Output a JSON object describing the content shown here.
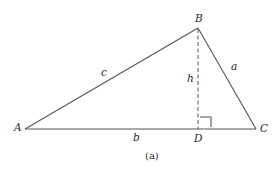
{
  "diagram": {
    "type": "triangle-with-altitude",
    "colors": {
      "line": "#555555",
      "text": "#2a2a2a",
      "background": "#ffffff"
    },
    "vertices": {
      "A": {
        "label": "A",
        "x": 25,
        "y": 129
      },
      "B": {
        "label": "B",
        "x": 198,
        "y": 28
      },
      "C": {
        "label": "C",
        "x": 256,
        "y": 129
      },
      "D": {
        "label": "D",
        "x": 198,
        "y": 129
      }
    },
    "sides": {
      "a": {
        "label": "a",
        "from": "B",
        "to": "C"
      },
      "b": {
        "label": "b",
        "from": "A",
        "to": "C"
      },
      "c": {
        "label": "c",
        "from": "A",
        "to": "B"
      }
    },
    "altitude": {
      "label": "h",
      "from": "B",
      "to": "D",
      "style": "dashed",
      "right_angle_marker": true
    },
    "caption": "(a)"
  }
}
